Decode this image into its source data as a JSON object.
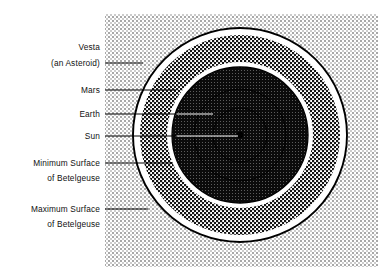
{
  "figure": {
    "type": "concentric-circles-scale-diagram",
    "background_color": "#ffffff",
    "panel_fill": "#f0f0f0",
    "stipple_color": "#9a9a9a",
    "line_color": "#000000",
    "center": {
      "x": 240,
      "y": 135
    },
    "panel": {
      "x": 105,
      "y": 14,
      "width": 273,
      "height": 253
    }
  },
  "labels": [
    {
      "id": "vesta",
      "name": "Vesta (an Asteroid)",
      "lines": [
        "Vesta",
        "(an Asteroid)"
      ],
      "leader_y": 63,
      "text_x": 100,
      "leader_x_start": 104,
      "leader_x_end": 143,
      "target_radius": 58
    },
    {
      "id": "mars",
      "name": "Mars",
      "lines": [
        "Mars"
      ],
      "leader_y": 90,
      "text_x": 100,
      "leader_x_start": 104,
      "leader_x_end": 176,
      "target_radius": 46
    },
    {
      "id": "earth",
      "name": "Earth",
      "lines": [
        "Earth"
      ],
      "leader_y": 114,
      "text_x": 100,
      "leader_x_start": 104,
      "leader_x_end": 213,
      "target_radius": 27
    },
    {
      "id": "sun",
      "name": "Sun",
      "lines": [
        "Sun"
      ],
      "leader_y": 136,
      "text_x": 100,
      "leader_x_start": 104,
      "leader_x_end": 239,
      "target_radius": 3
    },
    {
      "id": "minimum-surface",
      "name": "Minimum Surface of Betelgeuse",
      "lines": [
        "Minimum Surface",
        "of  Betelgeuse"
      ],
      "leader_y": 163,
      "text_x": 100,
      "leader_x_start": 104,
      "leader_x_end": 173,
      "target_radius": 68
    },
    {
      "id": "maximum-surface",
      "name": "Maximum Surface of Betelgeuse",
      "lines": [
        "Maximum Surface",
        "of Betelgeuse"
      ],
      "leader_y": 209,
      "text_x": 100,
      "leader_x_start": 104,
      "leader_x_end": 148,
      "target_radius": 107
    }
  ],
  "rings": [
    {
      "id": "maximum-surface-circle",
      "label": "Maximum Surface of Betelgeuse",
      "radius": 107,
      "fill": "none",
      "stroke": "#000000",
      "stroke_width": 1.8
    },
    {
      "id": "vesta-orbit-band-outer",
      "label": "Vesta orbit (outer edge)",
      "radius": 93,
      "fill": "checker-dark",
      "stroke": "none",
      "stroke_width": 0
    },
    {
      "id": "vesta-orbit-band-inner",
      "label": "Vesta orbit (inner edge)",
      "radius": 79,
      "fill": "white",
      "stroke": "none",
      "stroke_width": 0
    },
    {
      "id": "minimum-surface-circle",
      "label": "Minimum Surface of Betelgeuse",
      "radius": 68,
      "fill": "solid-dark",
      "stroke": "#000000",
      "stroke_width": 1.2
    },
    {
      "id": "mars-orbit",
      "label": "Mars orbit",
      "radius": 46,
      "fill": "none",
      "stroke": "#000000",
      "stroke_width": 0.9
    },
    {
      "id": "earth-orbit",
      "label": "Earth orbit",
      "radius": 27,
      "fill": "none",
      "stroke": "#000000",
      "stroke_width": 0.9
    },
    {
      "id": "sun-disc",
      "label": "Sun",
      "radius": 3,
      "fill": "#000000",
      "stroke": "none",
      "stroke_width": 0
    }
  ]
}
